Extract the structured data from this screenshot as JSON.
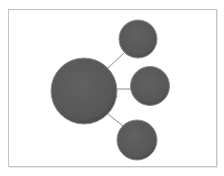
{
  "diagram": {
    "type": "radial-cluster",
    "colors": {
      "node_fill": "#5a5a5a",
      "node_rim": "#8c8c8c",
      "connector": "#8a8a8a",
      "frame_border": "#c4c4c4",
      "background": "#ffffff"
    },
    "center_node": {
      "cx": 84,
      "cy": 91,
      "r": 33,
      "label": ""
    },
    "satellite_nodes": [
      {
        "cx": 138,
        "cy": 39,
        "r": 19,
        "label": ""
      },
      {
        "cx": 150,
        "cy": 86,
        "r": 19.5,
        "label": ""
      },
      {
        "cx": 137,
        "cy": 140,
        "r": 20,
        "label": ""
      }
    ]
  }
}
